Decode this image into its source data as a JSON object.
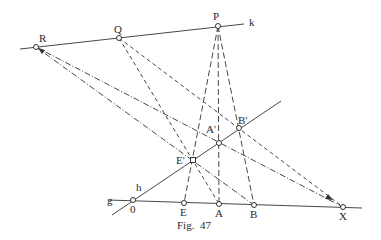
{
  "figure": {
    "caption": "Fig.  47",
    "colors": {
      "ink": "#333333",
      "background": "#ffffff"
    }
  },
  "lines": {
    "k": {
      "label": "k"
    },
    "g": {
      "label": "g"
    },
    "h": {
      "label": "h"
    }
  },
  "points": {
    "R": "R",
    "Q": "Q",
    "P": "P",
    "A_prime": "A'",
    "B_prime": "B'",
    "E_prime": "E'",
    "O": "0",
    "E": "E",
    "A": "A",
    "B": "B",
    "X": "X"
  }
}
